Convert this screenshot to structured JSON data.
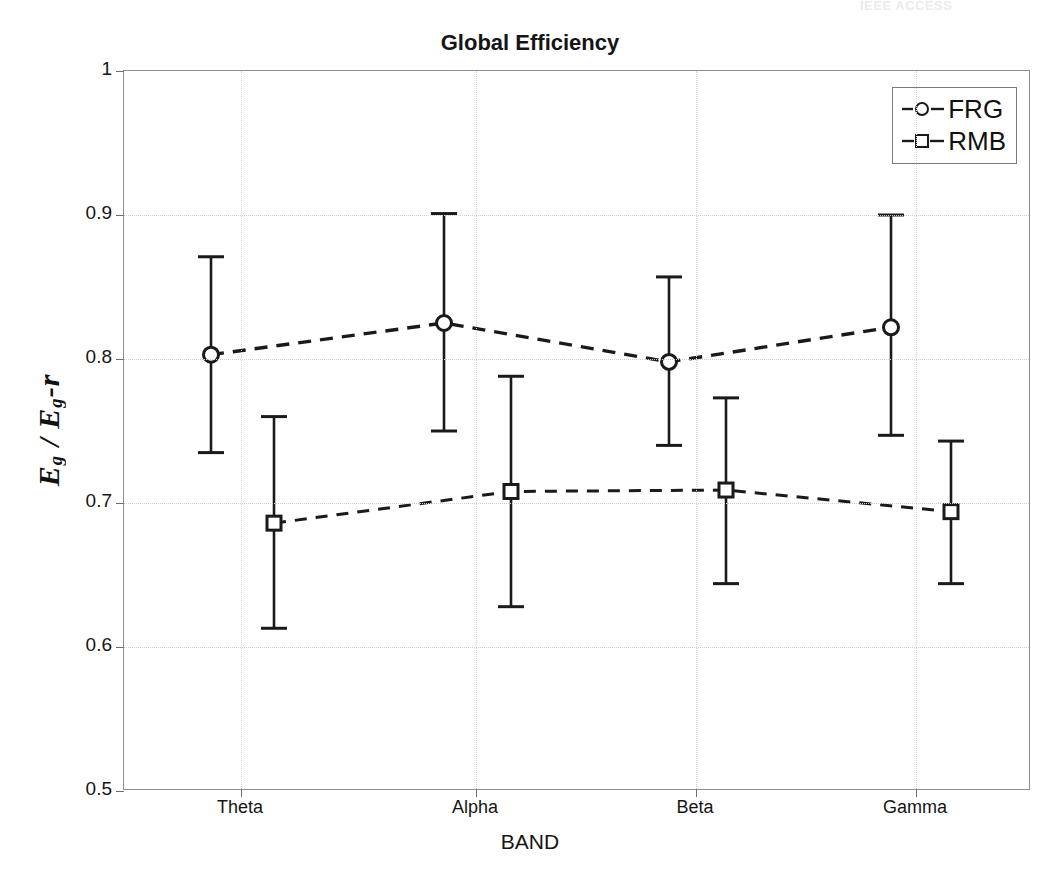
{
  "watermark": {
    "text": "IEEE ACCESS"
  },
  "chart_data": {
    "type": "line",
    "title": "Global Efficiency",
    "xlabel": "BAND",
    "ylabel": "E_g / E_g-r",
    "ylabel_parts": {
      "num": "E",
      "num_sub": "g",
      "den": "E",
      "den_sub": "g",
      "suffix": "-r"
    },
    "categories": [
      "Theta",
      "Alpha",
      "Beta",
      "Gamma"
    ],
    "yticks": [
      "0.5",
      "0.6",
      "0.7",
      "0.8",
      "0.9",
      "1"
    ],
    "ytick_values": [
      0.5,
      0.6,
      0.7,
      0.8,
      0.9,
      1.0
    ],
    "ylim": [
      0.5,
      1.0
    ],
    "grid": true,
    "legend_position": "top-right",
    "series": [
      {
        "name": "FRG",
        "marker": "circle",
        "linestyle": "dashed",
        "color": "#1a1a1a",
        "values": [
          0.803,
          0.825,
          0.798,
          0.822
        ],
        "err_low": [
          0.735,
          0.75,
          0.74,
          0.747
        ],
        "err_high": [
          0.871,
          0.901,
          0.857,
          0.9
        ]
      },
      {
        "name": "RMB",
        "marker": "square",
        "linestyle": "dashed",
        "color": "#1a1a1a",
        "values": [
          0.686,
          0.708,
          0.709,
          0.694
        ],
        "err_low": [
          0.613,
          0.628,
          0.644,
          0.644
        ],
        "err_high": [
          0.76,
          0.788,
          0.773,
          0.743
        ]
      }
    ]
  }
}
